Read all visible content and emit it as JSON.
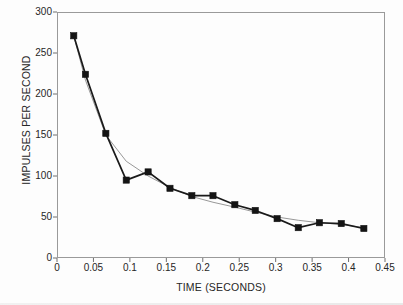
{
  "chart_data": {
    "type": "line",
    "title": "",
    "xlabel": "TIME (SECONDS)",
    "ylabel": "IMPULSES PER SECOND",
    "xlim": [
      0,
      0.45
    ],
    "ylim": [
      0,
      300
    ],
    "xticks": [
      "0",
      "0.05",
      "0.1",
      "0.15",
      "0.2",
      "0.25",
      "0.3",
      "0.35",
      "0.4",
      "0.45"
    ],
    "xtick_values": [
      0,
      0.05,
      0.1,
      0.15,
      0.2,
      0.25,
      0.3,
      0.35,
      0.4,
      0.45
    ],
    "yticks": [
      "0",
      "50",
      "100",
      "150",
      "200",
      "250",
      "300"
    ],
    "ytick_values": [
      0,
      50,
      100,
      150,
      200,
      250,
      300
    ],
    "grid": false,
    "legend": false,
    "legend_position": "none",
    "marker": "filled-square",
    "series": [
      {
        "name": "measured-impulse-rate",
        "style": "thick-black-line-with-square-markers",
        "color": "#1a1a1a",
        "x": [
          0.023,
          0.039,
          0.067,
          0.095,
          0.125,
          0.155,
          0.185,
          0.214,
          0.244,
          0.272,
          0.302,
          0.331,
          0.36,
          0.39,
          0.421
        ],
        "values": [
          271,
          224,
          152,
          95,
          105,
          85,
          76,
          76,
          65,
          58,
          48,
          37,
          43,
          42,
          36
        ]
      },
      {
        "name": "fitted-decay-curve",
        "style": "thin-gray-smooth-line",
        "color": "#8c8c8c",
        "x": [
          0.023,
          0.039,
          0.067,
          0.095,
          0.125,
          0.155,
          0.185,
          0.214,
          0.244,
          0.272,
          0.302,
          0.331,
          0.36,
          0.39,
          0.421
        ],
        "values": [
          271,
          217,
          150,
          118,
          100,
          86,
          75,
          68,
          62,
          56,
          50,
          46,
          43,
          41,
          37
        ]
      }
    ]
  }
}
